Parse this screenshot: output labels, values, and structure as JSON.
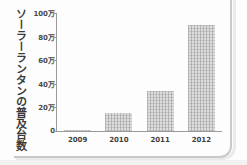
{
  "chart_data": {
    "type": "bar",
    "title": "",
    "xlabel": "",
    "ylabel": "ソーラーランタンの普及台数",
    "categories": [
      "2009",
      "2010",
      "2011",
      "2012"
    ],
    "values": [
      5000,
      150000,
      340000,
      900000
    ],
    "ylim": [
      0,
      1000000
    ],
    "ytick_values": [
      0,
      200000,
      400000,
      600000,
      800000,
      1000000
    ],
    "ytick_labels": [
      "0",
      "20万",
      "40万",
      "60万",
      "80万",
      "100万"
    ],
    "grid": false,
    "legend": false,
    "bar_color": "#dddddd",
    "axis_color": "#9b9b9b",
    "text_color": "#3a3a3a"
  },
  "axis": {
    "vertical_title": "ソーラーランタンの普及台数"
  },
  "ticks": {
    "y": [
      {
        "label": "100万",
        "value": 1000000
      },
      {
        "label": "80万",
        "value": 800000
      },
      {
        "label": "60万",
        "value": 600000
      },
      {
        "label": "40万",
        "value": 400000
      },
      {
        "label": "20万",
        "value": 200000
      },
      {
        "label": "0",
        "value": 0
      }
    ],
    "x": [
      {
        "label": "2009"
      },
      {
        "label": "2010"
      },
      {
        "label": "2011"
      },
      {
        "label": "2012"
      }
    ]
  }
}
